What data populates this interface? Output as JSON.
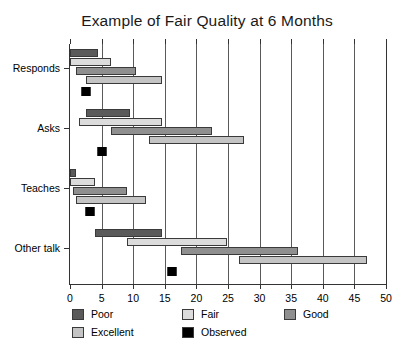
{
  "chart_data": {
    "type": "bar",
    "subtype": "floating-range-bar",
    "title": "Example of Fair Quality at 6 Months",
    "xlabel": "",
    "ylabel": "",
    "xlim": [
      0,
      50
    ],
    "xticks": [
      0,
      5,
      10,
      15,
      20,
      25,
      30,
      35,
      40,
      45,
      50
    ],
    "xticklabels": [
      "0",
      "5",
      "10",
      "15",
      "20",
      "25",
      "30",
      "35",
      "40",
      "45",
      "50"
    ],
    "grid": true,
    "grid_axis": "x",
    "legend_position": "bottom",
    "categories": [
      "Responds",
      "Asks",
      "Teaches",
      "Other talk"
    ],
    "series": [
      {
        "name": "Poor",
        "color": "#5a5a5a",
        "ranges": [
          {
            "category": "Responds",
            "start": 0.0,
            "end": 4.5
          },
          {
            "category": "Asks",
            "start": 2.5,
            "end": 9.5
          },
          {
            "category": "Teaches",
            "start": 0.0,
            "end": 1.0
          },
          {
            "category": "Other talk",
            "start": 4.0,
            "end": 14.5
          }
        ]
      },
      {
        "name": "Fair",
        "color": "#dcdcdc",
        "ranges": [
          {
            "category": "Responds",
            "start": 0.0,
            "end": 6.5
          },
          {
            "category": "Asks",
            "start": 1.5,
            "end": 14.5
          },
          {
            "category": "Teaches",
            "start": 0.0,
            "end": 4.0
          },
          {
            "category": "Other talk",
            "start": 9.0,
            "end": 24.8
          }
        ]
      },
      {
        "name": "Good",
        "color": "#8f8f8f",
        "ranges": [
          {
            "category": "Responds",
            "start": 1.0,
            "end": 10.5
          },
          {
            "category": "Asks",
            "start": 6.5,
            "end": 22.5
          },
          {
            "category": "Teaches",
            "start": 0.5,
            "end": 9.0
          },
          {
            "category": "Other talk",
            "start": 17.5,
            "end": 36.0
          }
        ]
      },
      {
        "name": "Excellent",
        "color": "#c4c4c4",
        "ranges": [
          {
            "category": "Responds",
            "start": 2.5,
            "end": 14.5
          },
          {
            "category": "Asks",
            "start": 12.5,
            "end": 27.5
          },
          {
            "category": "Teaches",
            "start": 1.0,
            "end": 12.0
          },
          {
            "category": "Other talk",
            "start": 26.8,
            "end": 47.0
          }
        ]
      }
    ],
    "observed": {
      "name": "Observed",
      "color": "#000000",
      "values": [
        {
          "category": "Responds",
          "value": 2.5
        },
        {
          "category": "Asks",
          "value": 5.0
        },
        {
          "category": "Teaches",
          "value": 3.2
        },
        {
          "category": "Other talk",
          "value": 16.2
        }
      ]
    },
    "legend": [
      {
        "label": "Poor",
        "color": "#5a5a5a"
      },
      {
        "label": "Fair",
        "color": "#dcdcdc"
      },
      {
        "label": "Good",
        "color": "#8f8f8f"
      },
      {
        "label": "Excellent",
        "color": "#c4c4c4"
      },
      {
        "label": "Observed",
        "color": "#000000"
      }
    ]
  }
}
